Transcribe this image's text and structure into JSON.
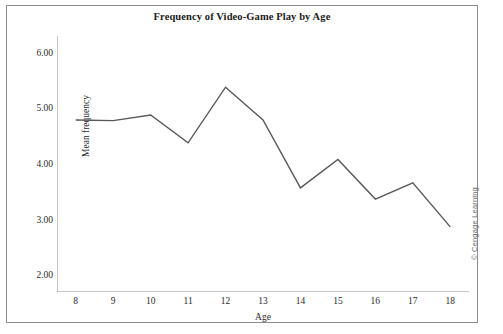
{
  "figure": {
    "title": "Frequency of Video-Game Play by Age",
    "credit": "© Cengage Learning",
    "frame_color": "#8d8d8d",
    "background": "#ffffff"
  },
  "chart_data": {
    "type": "line",
    "title": "Frequency of Video-Game Play by Age",
    "xlabel": "Age",
    "ylabel": "Mean frequency",
    "categories": [
      8,
      9,
      10,
      11,
      12,
      13,
      14,
      15,
      16,
      17,
      18
    ],
    "x_tick_labels": [
      "8",
      "9",
      "10",
      "11",
      "12",
      "13",
      "14",
      "15",
      "16",
      "17",
      "18"
    ],
    "y_tick_labels": [
      "2.00",
      "3.00",
      "4.00",
      "5.00",
      "6.00"
    ],
    "y_ticks": [
      2.0,
      3.0,
      4.0,
      5.0,
      6.0
    ],
    "xlim": [
      7.5,
      18.5
    ],
    "ylim": [
      1.7,
      6.3
    ],
    "grid": false,
    "legend": "none",
    "line_color": "#595959",
    "line_width": 1.4,
    "series": [
      {
        "name": "Mean frequency",
        "values": [
          4.79,
          4.78,
          4.88,
          4.38,
          5.38,
          4.79,
          3.57,
          4.08,
          3.37,
          3.66,
          2.87
        ]
      }
    ]
  }
}
